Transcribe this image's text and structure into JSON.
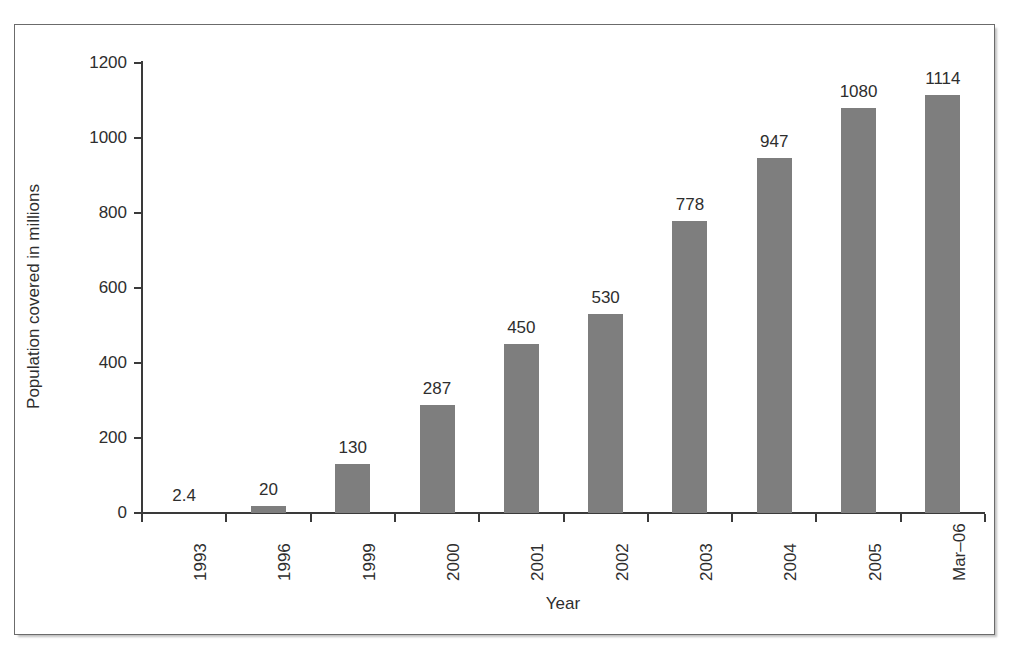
{
  "chart_data": {
    "type": "bar",
    "title": "",
    "xlabel": "Year",
    "ylabel": "Population covered in millions",
    "categories": [
      "1993",
      "1996",
      "1999",
      "2000",
      "2001",
      "2002",
      "2003",
      "2004",
      "2005",
      "Mar–06"
    ],
    "values": [
      2.4,
      20,
      130,
      287,
      450,
      530,
      778,
      947,
      1080,
      1114
    ],
    "value_labels": [
      "2.4",
      "20",
      "130",
      "287",
      "450",
      "530",
      "778",
      "947",
      "1080",
      "1114"
    ],
    "ylim": [
      0,
      1200
    ],
    "yticks": [
      0,
      200,
      400,
      600,
      800,
      1000,
      1200
    ],
    "ytick_labels": [
      "0",
      "200",
      "400",
      "600",
      "800",
      "1000",
      "1200"
    ],
    "grid": false,
    "legend": null,
    "bar_color": "#7e7e7e",
    "axis_color": "#3a3a3a",
    "text_color": "#2e2e2e",
    "background": "#ffffff",
    "xtick_rotation": -90,
    "data_labels_shown": true
  }
}
